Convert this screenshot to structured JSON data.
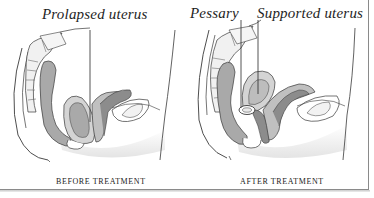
{
  "figure": {
    "panels": [
      {
        "id": "before",
        "caption": "BEFORE TREATMENT",
        "labels": [
          {
            "text": "Prolapsed uterus",
            "points_to": "uterus"
          }
        ]
      },
      {
        "id": "after",
        "caption": "AFTER TREATMENT",
        "labels": [
          {
            "text": "Pessary",
            "points_to": "pessary-ring"
          },
          {
            "text": "Supported uterus",
            "points_to": "uterus"
          }
        ]
      }
    ],
    "colors": {
      "line": "#3a3a3a",
      "tissue_light": "#d4d4d4",
      "tissue_mid": "#a9a9a9",
      "tissue_dark": "#8c8c8c",
      "shadow": "#e6e6e6",
      "border": "#8a8a8a"
    }
  }
}
